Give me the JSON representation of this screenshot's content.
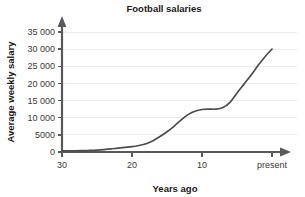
{
  "chart_data": {
    "type": "line",
    "title": "Football salaries",
    "xlabel": "Years ago",
    "ylabel": "Average weekly salary",
    "grid": true,
    "legend": null,
    "xlim": [
      30,
      0
    ],
    "ylim": [
      0,
      35000
    ],
    "x_axis_reversed": true,
    "x_tick_labels": [
      "30",
      "20",
      "10",
      "present"
    ],
    "x_tick_values": [
      30,
      20,
      10,
      0
    ],
    "y_tick_labels": [
      "0",
      "5000",
      "10 000",
      "15 000",
      "20 000",
      "25 000",
      "30 000",
      "35 000"
    ],
    "y_tick_values": [
      0,
      5000,
      10000,
      15000,
      20000,
      25000,
      30000,
      35000
    ],
    "x": [
      30,
      29,
      28,
      27,
      26,
      25,
      24,
      23,
      22,
      21,
      20,
      19,
      18,
      17,
      16,
      15,
      14,
      13,
      12,
      11,
      10,
      9,
      8,
      7,
      6,
      5,
      4,
      3,
      2,
      1,
      0
    ],
    "values": [
      300,
      320,
      350,
      400,
      460,
      550,
      700,
      900,
      1150,
      1350,
      1550,
      1900,
      2400,
      3300,
      4500,
      5900,
      7500,
      9300,
      10900,
      11900,
      12400,
      12500,
      12500,
      13000,
      14500,
      17200,
      19800,
      22400,
      25200,
      27800,
      30000
    ],
    "series_name": "Average weekly salary",
    "line_color": "#4d4d4d",
    "grid_color": "#ececec",
    "axis_color": "#595959",
    "annotations": []
  }
}
